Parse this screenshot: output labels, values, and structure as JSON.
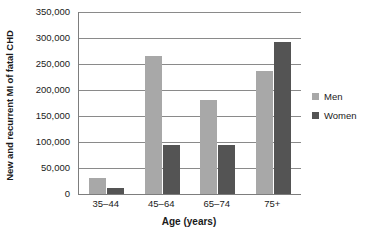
{
  "chart_data": {
    "type": "bar",
    "title": "",
    "xlabel": "Age (years)",
    "ylabel": "New and recurrent MI of fatal CHD",
    "categories": [
      "35–44",
      "45–64",
      "65–74",
      "75+"
    ],
    "series": [
      {
        "name": "Men",
        "color": "#a8a8a8",
        "values": [
          30000,
          265000,
          180000,
          237000
        ]
      },
      {
        "name": "Women",
        "color": "#545454",
        "values": [
          11000,
          95000,
          95000,
          292000
        ]
      }
    ],
    "ylim": [
      0,
      350000
    ],
    "yticks": [
      0,
      50000,
      100000,
      150000,
      200000,
      250000,
      300000,
      350000
    ],
    "ytick_labels": [
      "0",
      "50,000",
      "100,000",
      "150,000",
      "200,000",
      "250,000",
      "300,000",
      "350,000"
    ],
    "grid": true,
    "legend_position": "right"
  },
  "legend": {
    "items": [
      {
        "label": "Men"
      },
      {
        "label": "Women"
      }
    ]
  }
}
